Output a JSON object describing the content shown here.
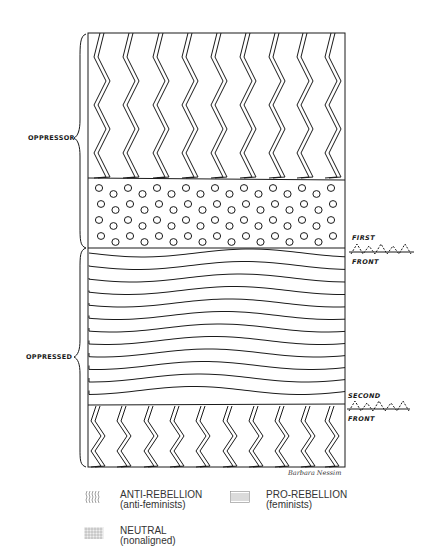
{
  "diagram": {
    "labels": {
      "oppressor": "OPPRESSOR",
      "oppressed": "OPPRESSED",
      "first_front_top": "FIRST",
      "first_front_bottom": "FRONT",
      "second_front_top": "SECOND",
      "second_front_bottom": "FRONT",
      "signature": "Barbara Nessim"
    },
    "bands": [
      {
        "name": "anti-rebellion-top",
        "pattern": "zigzag",
        "y_top": 33,
        "y_bottom": 178
      },
      {
        "name": "neutral",
        "pattern": "dots",
        "y_top": 178,
        "y_bottom": 248
      },
      {
        "name": "pro-rebellion",
        "pattern": "waves",
        "y_top": 248,
        "y_bottom": 405
      },
      {
        "name": "anti-rebellion-bottom",
        "pattern": "zigzag",
        "y_top": 405,
        "y_bottom": 467
      }
    ],
    "stroke_color": "#1a1a1a"
  },
  "legend": {
    "items": [
      {
        "key": "anti-rebellion",
        "label": "ANTI-REBELLION",
        "sublabel": "(anti-feminists)",
        "swatch": "zigzag"
      },
      {
        "key": "pro-rebellion",
        "label": "PRO-REBELLION",
        "sublabel": "(feminists)",
        "swatch": "lines"
      },
      {
        "key": "neutral",
        "label": "NEUTRAL",
        "sublabel": "(nonaligned)",
        "swatch": "dots"
      }
    ]
  }
}
